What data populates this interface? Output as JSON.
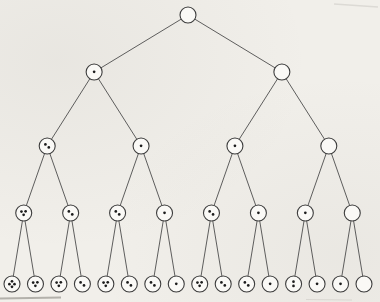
{
  "figure": {
    "name": "complete-binary-tree-with-dot-counts",
    "background": "#f1efea",
    "line_color": "#4d4d4d",
    "node_stroke": "#3c3c3c",
    "node_fill": "#faf9f6",
    "dot_color": "#1c1c1c",
    "artifact_color": "#8a8781",
    "levels": [
      {
        "dots": [
          0
        ]
      },
      {
        "dots": [
          1,
          0
        ]
      },
      {
        "dots": [
          2,
          1,
          1,
          0
        ]
      },
      {
        "dots": [
          3,
          2,
          2,
          1,
          2,
          1,
          1,
          0
        ]
      },
      {
        "dots": [
          4,
          3,
          3,
          2,
          3,
          2,
          2,
          1,
          3,
          2,
          2,
          1,
          2,
          1,
          1,
          0
        ]
      }
    ],
    "two_dot_vertical_nodes": [
      [
        4,
        12
      ]
    ]
  }
}
